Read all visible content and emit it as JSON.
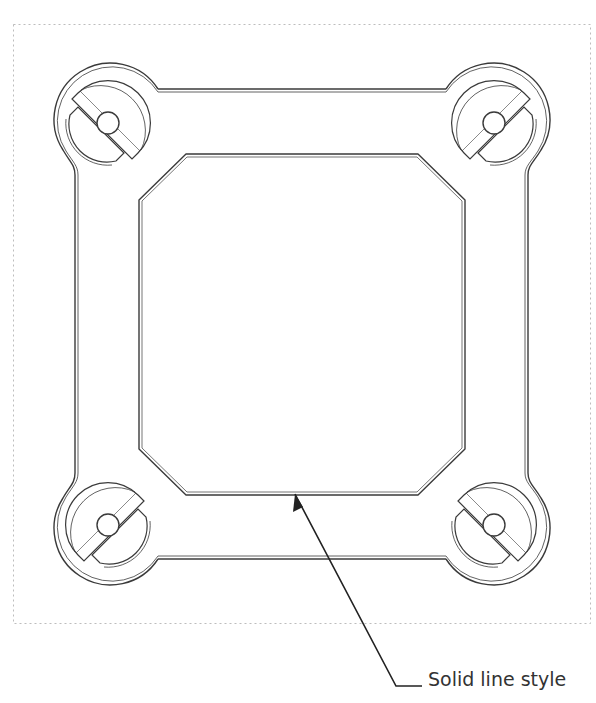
{
  "drawing": {
    "frame": {
      "x": 13,
      "y": 24,
      "width": 578,
      "height": 600,
      "style": "dotted",
      "color": "#bdbdbd"
    },
    "line_color": "#3a3a3a",
    "outer_plate": {
      "left": 76,
      "top": 90,
      "right": 527,
      "bottom": 558
    },
    "inner_opening": {
      "left": 140,
      "top": 155,
      "right": 464,
      "bottom": 494,
      "chamfer": 46
    },
    "mount_lobes": [
      {
        "name": "top-left",
        "cx": 108,
        "cy": 123,
        "slot": "backslash"
      },
      {
        "name": "top-right",
        "cx": 494,
        "cy": 123,
        "slot": "slash"
      },
      {
        "name": "bottom-left",
        "cx": 108,
        "cy": 525,
        "slot": "slash"
      },
      {
        "name": "bottom-right",
        "cx": 494,
        "cy": 525,
        "slot": "backslash"
      }
    ]
  },
  "callout": {
    "label": "Solid line style",
    "arrow_tip": [
      295,
      494
    ],
    "elbow": [
      396,
      686
    ],
    "end": [
      422,
      686
    ]
  }
}
